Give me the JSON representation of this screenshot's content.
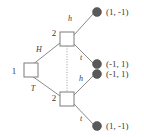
{
  "diagram": {
    "colors": {
      "edge": "#8a8a8a",
      "node_stroke": "#7d7d7d",
      "terminal_fill": "#595959",
      "text": "#3a3a3a",
      "background": "#ffffff"
    },
    "root": {
      "player_label": "1",
      "x": 24,
      "y": 70
    },
    "decision_nodes": [
      {
        "id": "upper-node",
        "player_label": "2",
        "x": 67,
        "y": 39
      },
      {
        "id": "lower-node",
        "player_label": "2",
        "x": 67,
        "y": 99
      }
    ],
    "information_set": {
      "style": "dotted",
      "from_node": "upper-node",
      "to_node": "lower-node"
    },
    "edges": [
      {
        "id": "edge-root-H",
        "label": "H",
        "from": "root",
        "to": "upper-node",
        "label_x": 39,
        "label_y": 50
      },
      {
        "id": "edge-root-T",
        "label": "T",
        "from": "root",
        "to": "lower-node",
        "label_x": 33,
        "label_y": 89
      },
      {
        "id": "edge-upper-h",
        "label": "h",
        "from": "upper-node",
        "to": "terminal-1",
        "label_x": 69,
        "label_y": 19
      },
      {
        "id": "edge-upper-t",
        "label": "t",
        "from": "upper-node",
        "to": "terminal-2",
        "label_x": 79,
        "label_y": 58
      },
      {
        "id": "edge-lower-h",
        "label": "h",
        "from": "lower-node",
        "to": "terminal-3",
        "label_x": 79,
        "label_y": 79
      },
      {
        "id": "edge-lower-t",
        "label": "t",
        "from": "lower-node",
        "to": "terminal-4",
        "label_x": 79,
        "label_y": 119
      }
    ],
    "terminal_nodes": [
      {
        "id": "terminal-1",
        "payoff": "(1, -1)",
        "x": 97,
        "y": 12
      },
      {
        "id": "terminal-2",
        "payoff": "(-1, 1)",
        "x": 97,
        "y": 64
      },
      {
        "id": "terminal-3",
        "payoff": "(-1, 1)",
        "x": 97,
        "y": 74
      },
      {
        "id": "terminal-4",
        "payoff": "(1, -1)",
        "x": 97,
        "y": 126
      }
    ]
  }
}
